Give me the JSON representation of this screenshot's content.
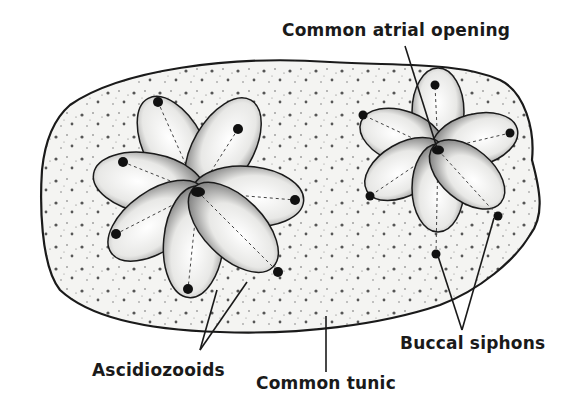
{
  "diagram": {
    "labels": {
      "common_atrial_opening": "Common atrial opening",
      "ascidiozooids": "Ascidiozooids",
      "common_tunic": "Common tunic",
      "buccal_siphons": "Buccal siphons"
    },
    "colors": {
      "ink": "#1a1a1a",
      "background": "#ffffff",
      "tunic_fill": "#f4f4f2",
      "zooid_fill": "#e6e6e4"
    }
  }
}
